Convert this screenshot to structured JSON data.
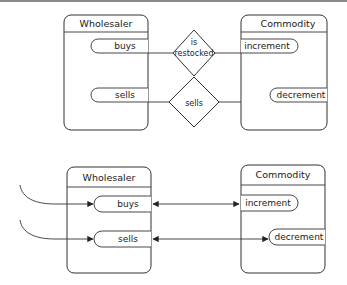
{
  "top_diagram": {
    "left_entity": {
      "title": "Wholesaler",
      "slots": [
        {
          "label": "buys"
        },
        {
          "label": "sells"
        }
      ]
    },
    "right_entity": {
      "title": "Commodity",
      "slots": [
        {
          "label": "increment"
        },
        {
          "label": "decrement"
        }
      ]
    },
    "relationships": [
      {
        "label_line1": "is",
        "label_line2": "restocked",
        "from": "buys",
        "to": "increment"
      },
      {
        "label": "sells",
        "from": "sells",
        "to": "decrement"
      }
    ]
  },
  "bottom_diagram": {
    "left_entity": {
      "title": "Wholesaler",
      "slots": [
        {
          "label": "buys"
        },
        {
          "label": "sells"
        }
      ]
    },
    "right_entity": {
      "title": "Commodity",
      "slots": [
        {
          "label": "increment"
        },
        {
          "label": "decrement"
        }
      ]
    },
    "connections": [
      {
        "from": "buys",
        "to": "increment",
        "type": "bidirectional-arrow"
      },
      {
        "from": "sells",
        "to": "decrement",
        "type": "bidirectional-arrow"
      }
    ],
    "incoming_arrows": [
      {
        "to": "buys",
        "type": "curved-arrow"
      },
      {
        "to": "sells",
        "type": "curved-arrow"
      }
    ]
  },
  "colors": {
    "stroke": "#333333",
    "text": "#1a1a1a",
    "top_rule": "#8a8a8a",
    "background": "#ffffff"
  }
}
